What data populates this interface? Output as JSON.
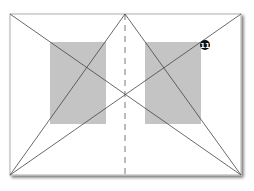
{
  "diagram": {
    "frame": {
      "x": 10,
      "y": 14,
      "width": 231,
      "height": 161,
      "stroke": "#bbbbbb",
      "shadow": "#888888"
    },
    "panels": [
      {
        "name": "left-panel",
        "x": 50,
        "y": 42,
        "width": 56,
        "height": 82,
        "fill": "#c4c4c4"
      },
      {
        "name": "right-panel",
        "x": 145,
        "y": 42,
        "width": 56,
        "height": 82,
        "fill": "#c4c4c4"
      }
    ],
    "lines_color": "#444444",
    "center_axis": {
      "x": 125,
      "y1": 14,
      "y2": 175,
      "dash": "6,5",
      "color": "#555555"
    },
    "marker": {
      "cx": 205,
      "cy": 45,
      "r": 5,
      "fill": "#111111",
      "label": "11"
    }
  }
}
